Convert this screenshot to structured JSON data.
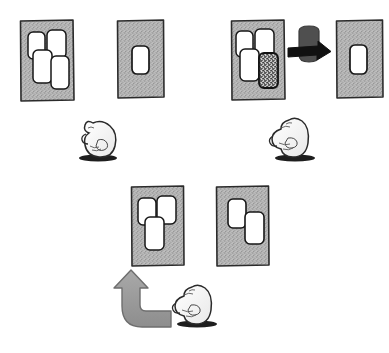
{
  "illustration": {
    "title": "Hand-drawn sequence of gray panels with white blocks and bird figures",
    "style": "hand-drawn ink cartoon, stippled gray fill",
    "background_color": "#ffffff",
    "panel_fill_color": "#b5b5b5",
    "panel_stroke_color": "#2b2b2b",
    "block_fill_color": "#ffffff",
    "block_stroke_color": "#1a1a1a",
    "dark_block_fill_color": "#3a3a3a",
    "arrow_black_color": "#111111",
    "arrow_gray_color": "#9a9a9a",
    "figure_ink_color": "#2a2a2a",
    "shadow_color": "#1e1e1e"
  },
  "rows": [
    {
      "row_name": "top-row",
      "panels": [
        {
          "panel_name": "top-left-panel",
          "label": "panel with four white blocks",
          "x": 20,
          "y": 20,
          "width": 54,
          "height": 81,
          "blocks": [
            {
              "name": "block-a",
              "x": 8,
              "y": 12,
              "w": 17,
              "h": 27,
              "fill": "white"
            },
            {
              "name": "block-b",
              "x": 27,
              "y": 10,
              "w": 19,
              "h": 28,
              "fill": "white"
            },
            {
              "name": "block-c",
              "x": 13,
              "y": 30,
              "w": 19,
              "h": 33,
              "fill": "white"
            },
            {
              "name": "block-d",
              "x": 31,
              "y": 36,
              "w": 18,
              "h": 33,
              "fill": "white"
            }
          ]
        },
        {
          "panel_name": "top-second-panel",
          "label": "panel with one white block",
          "x": 117,
          "y": 20,
          "width": 47,
          "height": 78,
          "blocks": [
            {
              "name": "block-a",
              "x": 15,
              "y": 26,
              "w": 17,
              "h": 28,
              "fill": "white"
            }
          ]
        },
        {
          "panel_name": "top-third-panel",
          "label": "panel with three white blocks and one dark block",
          "x": 231,
          "y": 20,
          "width": 53,
          "height": 79,
          "blocks": [
            {
              "name": "block-a",
              "x": 5,
              "y": 11,
              "w": 17,
              "h": 26,
              "fill": "white"
            },
            {
              "name": "block-b",
              "x": 24,
              "y": 9,
              "w": 19,
              "h": 28,
              "fill": "white"
            },
            {
              "name": "block-c",
              "x": 9,
              "y": 29,
              "w": 19,
              "h": 32,
              "fill": "white"
            },
            {
              "name": "block-d",
              "x": 28,
              "y": 33,
              "w": 19,
              "h": 35,
              "fill": "dark"
            }
          ]
        },
        {
          "panel_name": "top-right-panel",
          "label": "panel with one white block",
          "x": 336,
          "y": 20,
          "width": 47,
          "height": 78,
          "blocks": [
            {
              "name": "block-a",
              "x": 14,
              "y": 25,
              "w": 17,
              "h": 29,
              "fill": "white"
            }
          ]
        }
      ]
    },
    {
      "row_name": "bottom-row",
      "panels": [
        {
          "panel_name": "bottom-left-panel",
          "label": "panel with three white blocks",
          "x": 131,
          "y": 186,
          "width": 53,
          "height": 80,
          "blocks": [
            {
              "name": "block-a",
              "x": 7,
              "y": 12,
              "w": 18,
              "h": 27,
              "fill": "white"
            },
            {
              "name": "block-b",
              "x": 26,
              "y": 10,
              "w": 19,
              "h": 28,
              "fill": "white"
            },
            {
              "name": "block-c",
              "x": 14,
              "y": 31,
              "w": 19,
              "h": 33,
              "fill": "white"
            }
          ]
        },
        {
          "panel_name": "bottom-right-panel",
          "label": "panel with two white blocks",
          "x": 216,
          "y": 186,
          "width": 53,
          "height": 80,
          "blocks": [
            {
              "name": "block-a",
              "x": 12,
              "y": 13,
              "w": 18,
              "h": 29,
              "fill": "white"
            },
            {
              "name": "block-b",
              "x": 29,
              "y": 26,
              "w": 19,
              "h": 32,
              "fill": "white"
            }
          ]
        }
      ]
    }
  ],
  "figures": [
    {
      "name": "bird-figure-left",
      "facing": "left",
      "x": 78,
      "y": 114,
      "width": 44,
      "height": 46
    },
    {
      "name": "bird-figure-right",
      "facing": "left",
      "x": 272,
      "y": 113,
      "width": 46,
      "height": 47
    },
    {
      "name": "bird-figure-bottom",
      "facing": "left",
      "x": 175,
      "y": 280,
      "width": 45,
      "height": 46
    }
  ],
  "arrows": [
    {
      "name": "black-right-arrow",
      "direction": "right",
      "x": 288,
      "y": 46,
      "width": 42,
      "height": 18,
      "color": "#111111"
    },
    {
      "name": "dark-removed-block",
      "x": 297,
      "y": 28,
      "width": 22,
      "height": 34,
      "color": "#4a4a4a"
    },
    {
      "name": "gray-curved-up-arrow",
      "direction": "up-left-curve",
      "x": 118,
      "y": 271,
      "width": 56,
      "height": 58,
      "color": "#9a9a9a"
    }
  ]
}
